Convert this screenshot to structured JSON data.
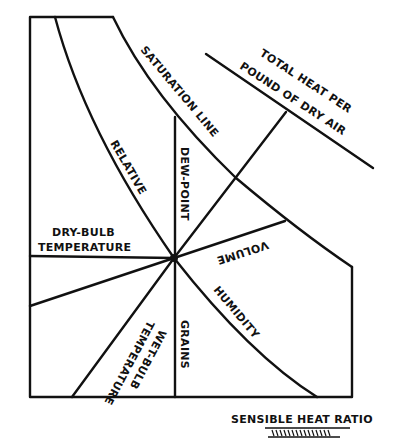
{
  "diagram": {
    "type": "psychrometric-chart-protractor",
    "labels": {
      "saturation_line": "SATURATION LINE",
      "total_heat_line1": "TOTAL HEAT PER",
      "total_heat_line2": "POUND OF DRY AIR",
      "relative": "RELATIVE",
      "dew_point": "DEW-POINT",
      "dry_bulb_line1": "DRY-BULB",
      "dry_bulb_line2": "TEMPERATURE",
      "volume": "VOLUME",
      "humidity": "HUMIDITY",
      "wet_bulb_line1": "WET-BULB",
      "wet_bulb_line2": "TEMPERATURE",
      "grains": "GRAINS",
      "sensible_heat_ratio": "SENSIBLE HEAT RATIO"
    },
    "colors": {
      "ink": "#111111",
      "background": "#ffffff"
    }
  }
}
